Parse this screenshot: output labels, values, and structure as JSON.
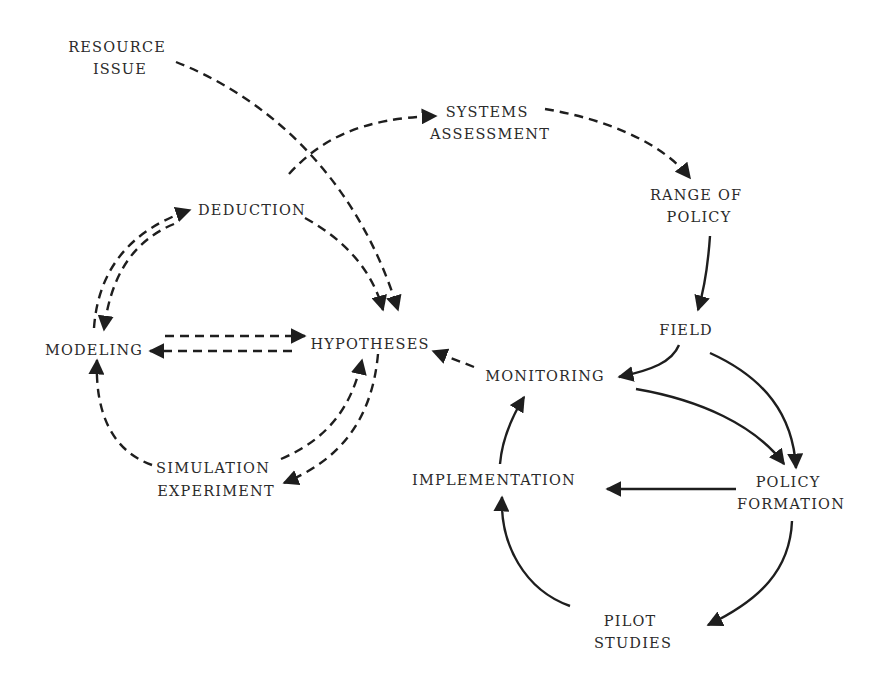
{
  "diagram": {
    "type": "flow-cycle",
    "line_color": "#1e1e1e",
    "text_color": "#2a2a2a",
    "background": "#ffffff",
    "nodes": [
      {
        "id": "resource_issue",
        "lines": [
          "RESOURCE",
          "ISSUE"
        ]
      },
      {
        "id": "systems_assessment",
        "lines": [
          "SYSTEMS",
          "ASSESSMENT"
        ]
      },
      {
        "id": "range_of_policy",
        "lines": [
          "RANGE OF",
          "POLICY"
        ]
      },
      {
        "id": "deduction",
        "lines": [
          "DEDUCTION"
        ]
      },
      {
        "id": "modeling",
        "lines": [
          "MODELING"
        ]
      },
      {
        "id": "hypotheses",
        "lines": [
          "HYPOTHESES"
        ]
      },
      {
        "id": "field",
        "lines": [
          "FIELD"
        ]
      },
      {
        "id": "monitoring",
        "lines": [
          "MONITORING"
        ]
      },
      {
        "id": "simulation_experiment",
        "lines": [
          "SIMULATION",
          "EXPERIMENT"
        ]
      },
      {
        "id": "implementation",
        "lines": [
          "IMPLEMENTATION"
        ]
      },
      {
        "id": "policy_formation",
        "lines": [
          "POLICY",
          "FORMATION"
        ]
      },
      {
        "id": "pilot_studies",
        "lines": [
          "PILOT",
          "STUDIES"
        ]
      }
    ],
    "edges": [
      {
        "from": "resource_issue",
        "to": "hypotheses",
        "style": "dashed"
      },
      {
        "from": "hypotheses",
        "to": "systems_assessment",
        "style": "dashed"
      },
      {
        "from": "systems_assessment",
        "to": "range_of_policy",
        "style": "dashed"
      },
      {
        "from": "range_of_policy",
        "to": "field",
        "style": "solid"
      },
      {
        "from": "deduction",
        "to": "hypotheses",
        "style": "dashed"
      },
      {
        "from": "modeling",
        "to": "deduction",
        "style": "dashed"
      },
      {
        "from": "deduction",
        "to": "modeling",
        "style": "dashed"
      },
      {
        "from": "modeling",
        "to": "hypotheses",
        "style": "dashed"
      },
      {
        "from": "hypotheses",
        "to": "modeling",
        "style": "dashed"
      },
      {
        "from": "simulation_experiment",
        "to": "modeling",
        "style": "dashed"
      },
      {
        "from": "simulation_experiment",
        "to": "hypotheses",
        "style": "dashed"
      },
      {
        "from": "hypotheses",
        "to": "simulation_experiment",
        "style": "dashed"
      },
      {
        "from": "monitoring",
        "to": "hypotheses",
        "style": "dashed"
      },
      {
        "from": "field",
        "to": "monitoring",
        "style": "solid"
      },
      {
        "from": "field",
        "to": "policy_formation",
        "style": "solid"
      },
      {
        "from": "monitoring",
        "to": "policy_formation",
        "style": "solid"
      },
      {
        "from": "policy_formation",
        "to": "implementation",
        "style": "solid"
      },
      {
        "from": "policy_formation",
        "to": "pilot_studies",
        "style": "solid"
      },
      {
        "from": "pilot_studies",
        "to": "implementation",
        "style": "solid"
      },
      {
        "from": "implementation",
        "to": "monitoring",
        "style": "solid"
      }
    ]
  }
}
